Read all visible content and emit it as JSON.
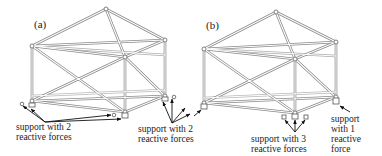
{
  "figure": {
    "panels": [
      {
        "id": "a",
        "label": "(a)",
        "nodes": {
          "apex": [
            106,
            9
          ],
          "top_left": [
            32,
            46
          ],
          "top_right": [
            165,
            40
          ],
          "top_front": [
            125,
            57
          ],
          "bottom_left": [
            32,
            101
          ],
          "bottom_front": [
            125,
            112
          ],
          "bottom_right": [
            165,
            96
          ]
        },
        "annotations": [
          {
            "text": "support with 2\nreactive forces",
            "x": 16,
            "y": 122
          },
          {
            "text": "support with 2\nreactive forces",
            "x": 138,
            "y": 124
          }
        ]
      },
      {
        "id": "b",
        "label": "(b)",
        "nodes": {
          "apex": [
            276,
            12
          ],
          "top_left": [
            204,
            49
          ],
          "top_right": [
            336,
            42
          ],
          "top_front": [
            295,
            59
          ],
          "bottom_left": [
            204,
            103
          ],
          "bottom_front": [
            295,
            113
          ],
          "bottom_right": [
            336,
            97
          ]
        },
        "annotations": [
          {
            "text": "support with 3\nreactive forces",
            "x": 251,
            "y": 134
          },
          {
            "text": "support\nwith 1\nreactive\nforce",
            "x": 331,
            "y": 114
          }
        ]
      }
    ]
  },
  "text": {
    "panel_a_label": "(a)",
    "panel_b_label": "(b)",
    "a_support_left": "support with 2\nreactive forces",
    "a_support_right": "support with 2\nreactive forces",
    "b_support_middle": "support with 3\nreactive forces",
    "b_support_right": "support\nwith 1\nreactive\nforce"
  }
}
